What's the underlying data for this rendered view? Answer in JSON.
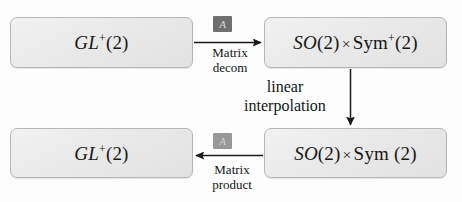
{
  "diagram": {
    "background_color": "#fdfdfd",
    "box_fill_color": "#eaeaea",
    "box_border_color": "#b6b6b6",
    "arrow_color": "#1a1a1a",
    "chip_color": "#6f6f6f",
    "nodes": [
      {
        "id": "gl-top",
        "text": "GL+(2)",
        "parts": {
          "italic": "GL",
          "sup": "+",
          "tail": "(2)"
        }
      },
      {
        "id": "so-sym-plus",
        "text": "SO(2) × Sym+(2)",
        "parts": {
          "italic": "SO",
          "mid": "(2)",
          "times": "×",
          "upright": "Sym",
          "sup": "+",
          "tail": "(2)"
        }
      },
      {
        "id": "so-sym",
        "text": "SO(2) × Sym (2)",
        "parts": {
          "italic": "SO",
          "mid": "(2)",
          "times": "×",
          "upright": "Sym",
          "sup": "",
          "tail": "(2)"
        }
      },
      {
        "id": "gl-bot",
        "text": "GL+(2)",
        "parts": {
          "italic": "GL",
          "sup": "+",
          "tail": "(2)"
        }
      }
    ],
    "edges": [
      {
        "id": "edge-top",
        "from": "gl-top",
        "to": "so-sym-plus",
        "direction": "right",
        "chip_label": "A",
        "caption_line1": "Matrix",
        "caption_line2": "decom"
      },
      {
        "id": "edge-vertical",
        "from": "so-sym-plus",
        "to": "so-sym",
        "direction": "down",
        "caption_line1": "linear",
        "caption_line2": "interpolation"
      },
      {
        "id": "edge-bottom",
        "from": "so-sym",
        "to": "gl-bot",
        "direction": "left",
        "chip_label": "A",
        "caption_line1": "Matrix",
        "caption_line2": "product"
      }
    ]
  }
}
